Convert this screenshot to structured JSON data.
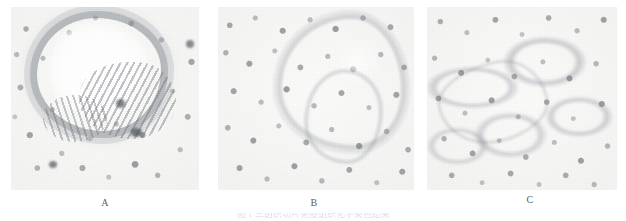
{
  "figure": {
    "kind": "photomicrograph-panel-figure",
    "panel_count": 3,
    "background_color": "#ffffff",
    "stain_tone": "#6c7078",
    "paper_tone": "#f3f3f1"
  },
  "panels": [
    {
      "id": "A",
      "label": "A",
      "name": "panel-a",
      "description": "glandular epithelium with central lumen"
    },
    {
      "id": "B",
      "label": "B",
      "name": "panel-b",
      "description": "diffuse nuclei with curving epithelial band"
    },
    {
      "id": "C",
      "label": "C",
      "name": "panel-c",
      "description": "lacy alveolar network with septal strands"
    }
  ],
  "caption": {
    "line": "图 1 三组织切片免疫组织化学染色结果"
  }
}
